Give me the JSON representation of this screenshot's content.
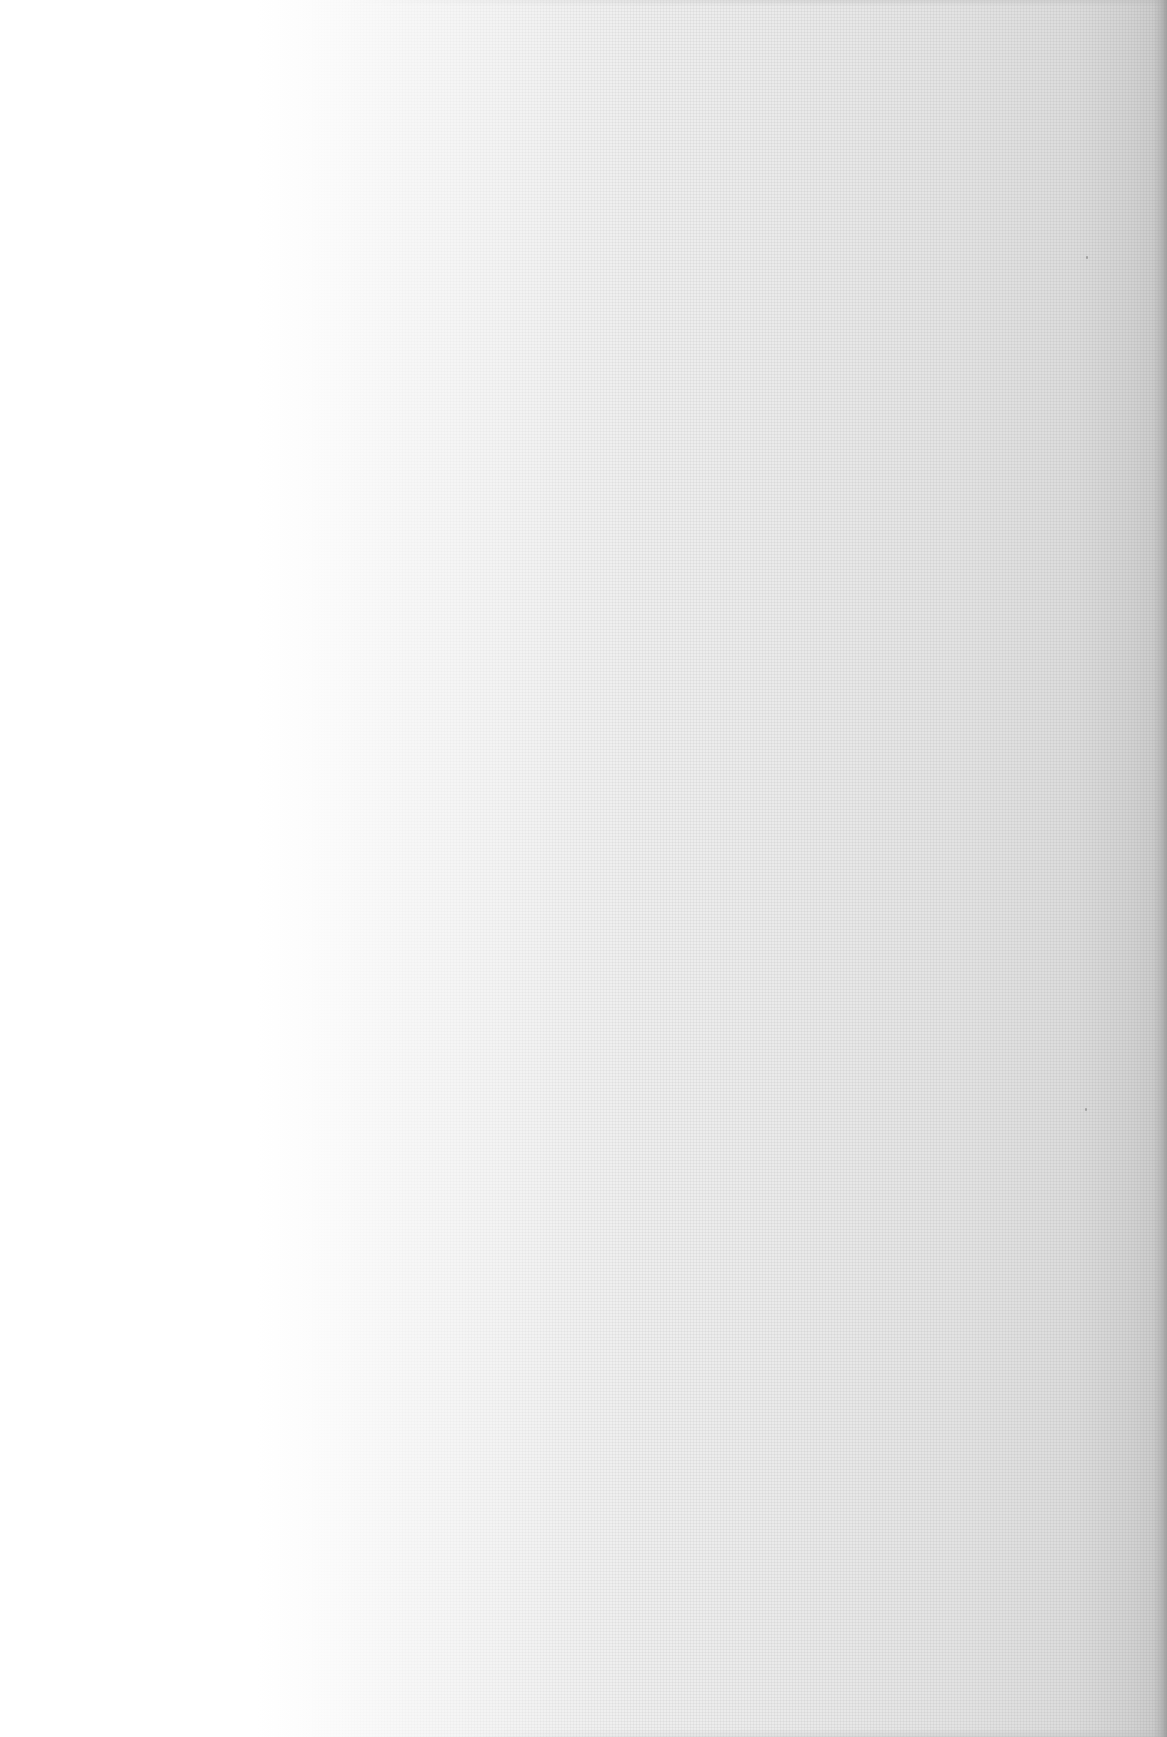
{
  "document": {
    "type": "blank-scanned-page",
    "text": "",
    "background": {
      "left_color": "#ffffff",
      "mid_color": "#f0f0f0",
      "right_color": "#d2d2d2",
      "edge_color": "#c8c8c8"
    }
  }
}
